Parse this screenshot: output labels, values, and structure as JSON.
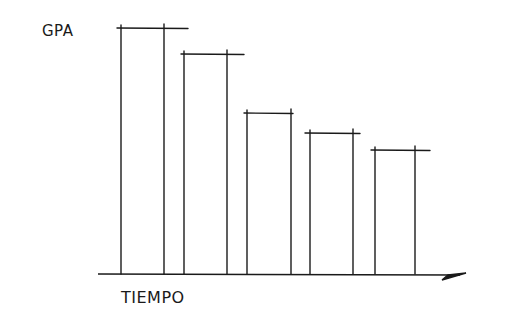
{
  "chart_data": {
    "type": "bar",
    "style": "hand-drawn sketch, outlined bars without fill, no tick labels",
    "title": "",
    "xlabel": "TIEMPO",
    "ylabel": "GPA",
    "categories": [
      "1",
      "2",
      "3",
      "4",
      "5"
    ],
    "values": [
      100,
      89,
      65,
      57,
      50
    ],
    "value_units": "relative height (% of tallest bar); no numeric scale shown",
    "trend": "decreasing over time",
    "grid": false,
    "legend": null,
    "x_axis_arrow": true,
    "colors": {
      "stroke": "#1a1a1a",
      "background": "#ffffff"
    }
  },
  "labels": {
    "y_axis": "GPA",
    "x_axis": "TIEMPO"
  },
  "geometry": {
    "baseline_y": 274,
    "axis_x_start": 98,
    "axis_x_end": 466,
    "bars": [
      {
        "left": 121,
        "right": 164,
        "top": 28,
        "cap_left": 117,
        "cap_right": 188
      },
      {
        "left": 184,
        "right": 227,
        "top": 54,
        "cap_left": 181,
        "cap_right": 244
      },
      {
        "left": 247,
        "right": 291,
        "top": 113,
        "cap_left": 244,
        "cap_right": 293
      },
      {
        "left": 310,
        "right": 353,
        "top": 133,
        "cap_left": 305,
        "cap_right": 360
      },
      {
        "left": 375,
        "right": 415,
        "top": 150,
        "cap_left": 371,
        "cap_right": 430
      }
    ]
  }
}
